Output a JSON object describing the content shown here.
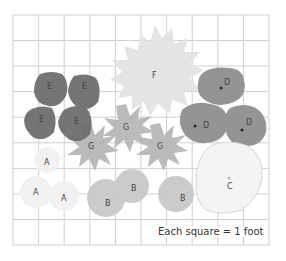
{
  "caption": "Each square = 1 foot",
  "grid": {
    "columns": 10,
    "rows": 9,
    "unit": "1 foot",
    "line_color": "#cfcfcf"
  },
  "colors": {
    "A": "#f1f1f1",
    "B": "#c9c9c9",
    "C": "#f4f4f4",
    "D": "#8f8f8f",
    "E": "#6e6e6e",
    "F": "#e3e3e3",
    "G": "#b4b4b4"
  },
  "plants": [
    {
      "label": "F",
      "x": 155,
      "y": 75
    },
    {
      "label": "E",
      "x": 50,
      "y": 86
    },
    {
      "label": "E",
      "x": 85,
      "y": 86
    },
    {
      "label": "E",
      "x": 42,
      "y": 119
    },
    {
      "label": "E",
      "x": 77,
      "y": 121
    },
    {
      "label": "D",
      "x": 228,
      "y": 82
    },
    {
      "label": "D",
      "x": 207,
      "y": 125
    },
    {
      "label": "D",
      "x": 250,
      "y": 122
    },
    {
      "label": "G",
      "x": 126,
      "y": 127
    },
    {
      "label": "G",
      "x": 91,
      "y": 146
    },
    {
      "label": "G",
      "x": 160,
      "y": 146
    },
    {
      "label": "A",
      "x": 47,
      "y": 162
    },
    {
      "label": "A",
      "x": 36,
      "y": 192
    },
    {
      "label": "A",
      "x": 64,
      "y": 198
    },
    {
      "label": "B",
      "x": 134,
      "y": 188
    },
    {
      "label": "B",
      "x": 108,
      "y": 203
    },
    {
      "label": "B",
      "x": 183,
      "y": 198
    },
    {
      "label": "C",
      "x": 230,
      "y": 186
    }
  ]
}
